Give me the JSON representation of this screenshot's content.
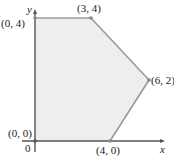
{
  "diagram": {
    "type": "feasible-region",
    "axes": {
      "x_label": "x",
      "y_label": "y",
      "origin_label": "0"
    },
    "vertices": [
      {
        "label": "(0, 0)",
        "x": 0,
        "y": 0
      },
      {
        "label": "(0, 4)",
        "x": 0,
        "y": 4
      },
      {
        "label": "(3, 4)",
        "x": 3,
        "y": 4
      },
      {
        "label": "(6, 2)",
        "x": 6,
        "y": 2
      },
      {
        "label": "(4, 0)",
        "x": 4,
        "y": 0
      }
    ],
    "colors": {
      "fill": "#eeeeee",
      "edge": "#9a9a9a",
      "axis": "#555555",
      "vertex": "#888888"
    }
  }
}
